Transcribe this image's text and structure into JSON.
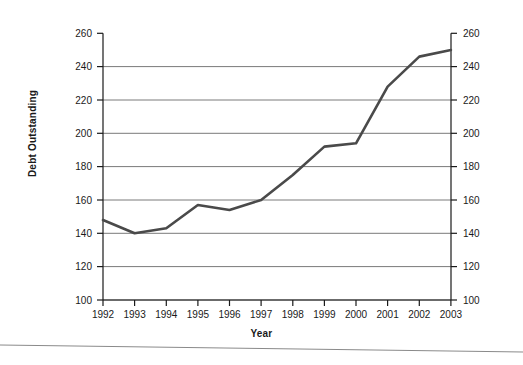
{
  "chart_data": {
    "type": "line",
    "title": "",
    "xlabel": "Year",
    "ylabel": "Debt Outstanding",
    "categories": [
      "1992",
      "1993",
      "1994",
      "1995",
      "1996",
      "1997",
      "1998",
      "1999",
      "2000",
      "2001",
      "2002",
      "2003"
    ],
    "x": [
      1992,
      1993,
      1994,
      1995,
      1996,
      1997,
      1998,
      1999,
      2000,
      2001,
      2002,
      2003
    ],
    "values": [
      148,
      140,
      143,
      157,
      154,
      160,
      175,
      192,
      194,
      228,
      246,
      250
    ],
    "series": [
      {
        "name": "Debt Outstanding",
        "values": [
          148,
          140,
          143,
          157,
          154,
          160,
          175,
          192,
          194,
          228,
          246,
          250
        ],
        "color": "#4a4a4a"
      }
    ],
    "ylim": [
      100,
      260
    ],
    "yticks": [
      100,
      120,
      140,
      160,
      180,
      200,
      220,
      240,
      260
    ],
    "ytick_labels": [
      "100",
      "120",
      "140",
      "160",
      "180",
      "200",
      "220",
      "240",
      "260"
    ],
    "ytick_labels_right": [
      "100",
      "120",
      "140",
      "160",
      "180",
      "200",
      "220",
      "240",
      "260"
    ],
    "xtick_labels": [
      "1992",
      "1993",
      "1994",
      "1995",
      "1996",
      "1997",
      "1998",
      "1999",
      "2000",
      "2001",
      "2002",
      "2003"
    ],
    "grid": "horizontal",
    "legend": "none",
    "dual_y_axis": true,
    "line_color": "#4a4a4a",
    "gridline_color": "#7a7a7a",
    "axis_color": "#1a1a1a",
    "background": "#ffffff"
  },
  "footer": {
    "rule_visible": true
  }
}
